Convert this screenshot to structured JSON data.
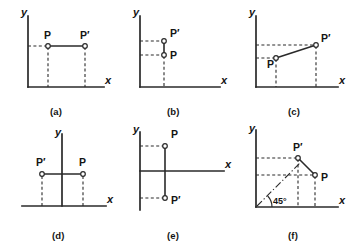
{
  "figure": {
    "title": "",
    "background_color": "#ffffff",
    "ink_color": "#2a2a2a",
    "panel_count": 6
  },
  "labels": {
    "x_axis": "x",
    "y_axis": "y",
    "point_p": "P",
    "point_p_prime": "P′",
    "angle_45": "45°"
  },
  "panels": [
    {
      "id": "a",
      "caption": "(a)",
      "description": "Horizontal translation: P and P' at same height, P' to the right of P",
      "axes": {
        "x": "x",
        "y": "y",
        "x_direction": "right",
        "y_direction": "up"
      },
      "points": [
        {
          "name": "P",
          "label": "P",
          "x": 1.2,
          "y": 2.0,
          "label_position": "above"
        },
        {
          "name": "P'",
          "label": "P′",
          "x": 3.4,
          "y": 2.0,
          "label_position": "above"
        }
      ],
      "connector": {
        "type": "solid",
        "from": "P",
        "to": "P'"
      },
      "guides": [
        "dashed projection to x-axis from P",
        "dashed projection to x-axis from P'",
        "dashed projection to y-axis from P"
      ]
    },
    {
      "id": "b",
      "caption": "(b)",
      "description": "Vertical translation: P and P' on same vertical line, P' above P",
      "axes": {
        "x": "x",
        "y": "y",
        "x_direction": "right",
        "y_direction": "up"
      },
      "points": [
        {
          "name": "P",
          "label": "P",
          "x": 1.2,
          "y": 2.05,
          "label_position": "right"
        },
        {
          "name": "P'",
          "label": "P′",
          "x": 1.2,
          "y": 2.85,
          "label_position": "right"
        }
      ],
      "connector": {
        "type": "solid",
        "from": "P",
        "to": "P'"
      },
      "guides": [
        "dashed projection to y-axis from P",
        "dashed projection to y-axis from P'",
        "dashed projection to x-axis from P"
      ]
    },
    {
      "id": "c",
      "caption": "(c)",
      "description": "Oblique translation: P lower-left, P' upper-right, joined by a solid segment",
      "axes": {
        "x": "x",
        "y": "y",
        "x_direction": "right",
        "y_direction": "up"
      },
      "points": [
        {
          "name": "P",
          "label": "P",
          "x": 1.15,
          "y": 1.55,
          "label_position": "below-left"
        },
        {
          "name": "P'",
          "label": "P′",
          "x": 3.35,
          "y": 2.35,
          "label_position": "right"
        }
      ],
      "connector": {
        "type": "solid",
        "from": "P",
        "to": "P'"
      },
      "guides": [
        "dashed projections to both axes from P and P'"
      ]
    },
    {
      "id": "d",
      "caption": "(d)",
      "description": "Reflection about the y-axis: P right of axis, P' left of axis at equal height",
      "axes": {
        "x": "x",
        "y": "y",
        "x_direction": "right",
        "y_direction": "up",
        "x_extends_left": true
      },
      "points": [
        {
          "name": "P'",
          "label": "P′",
          "x": -1.25,
          "y": 1.45,
          "label_position": "above"
        },
        {
          "name": "P",
          "label": "P",
          "x": 1.25,
          "y": 1.45,
          "label_position": "above"
        }
      ],
      "connector": {
        "type": "solid",
        "from": "P'",
        "to": "P"
      },
      "guides": [
        "dashed projection to x-axis from P",
        "dashed projection to x-axis from P'"
      ]
    },
    {
      "id": "e",
      "caption": "(e)",
      "description": "Reflection about the x-axis: P above axis, P' below axis at equal distance",
      "axes": {
        "x": "x",
        "y": "y",
        "x_direction": "right",
        "y_direction": "up",
        "y_extends_down": true
      },
      "points": [
        {
          "name": "P",
          "label": "P",
          "x": 1.15,
          "y": 1.45,
          "label_position": "above-right"
        },
        {
          "name": "P'",
          "label": "P′",
          "x": 1.15,
          "y": -1.45,
          "label_position": "right"
        }
      ],
      "connector": {
        "type": "solid",
        "from": "P",
        "to": "P'"
      },
      "guides": [
        "dashed projection to y-axis from P",
        "dashed projection to y-axis from P'"
      ]
    },
    {
      "id": "f",
      "caption": "(f)",
      "description": "Reflection about the 45° line through the origin: P and P' swap coordinates",
      "axes": {
        "x": "x",
        "y": "y",
        "x_direction": "right",
        "y_direction": "up"
      },
      "points": [
        {
          "name": "P'",
          "label": "P′",
          "x": 1.9,
          "y": 2.55,
          "label_position": "above"
        },
        {
          "name": "P",
          "label": "P",
          "x": 2.55,
          "y": 1.9,
          "label_position": "right"
        }
      ],
      "connector": {
        "type": "solid",
        "from": "P'",
        "to": "P"
      },
      "angle": {
        "label": "45°",
        "value": 45,
        "at": "origin"
      },
      "guides": [
        "dash-dot 45° line from origin",
        "dashed projections to both axes from P and P'"
      ]
    }
  ]
}
